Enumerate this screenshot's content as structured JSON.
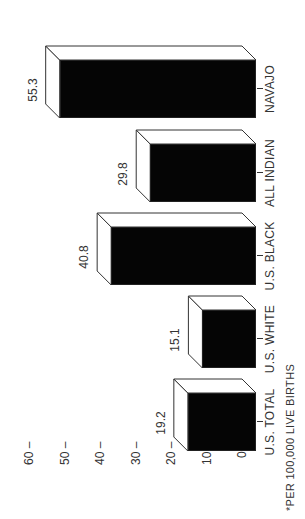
{
  "chart_data": {
    "type": "bar",
    "title": "",
    "xlabel": "",
    "ylabel": "",
    "categories": [
      "U.S. TOTAL",
      "U.S. WHITE",
      "U.S. BLACK",
      "ALL INDIAN",
      "NAVAJO"
    ],
    "values": [
      19.2,
      15.1,
      40.8,
      29.8,
      55.3
    ],
    "value_labels": [
      "19.2",
      "15.1",
      "40.8",
      "29.8",
      "55.3"
    ],
    "yticks": [
      "0",
      "10",
      "20",
      "30",
      "40",
      "50",
      "60"
    ],
    "ylim": [
      0,
      60
    ],
    "grid": false,
    "legend": null,
    "style": "3d-bar",
    "orientation": "rotated 90° counter-clockwise",
    "footnote": "*PER 100,000 LIVE BIRTHS",
    "bar_color": "#050505"
  }
}
